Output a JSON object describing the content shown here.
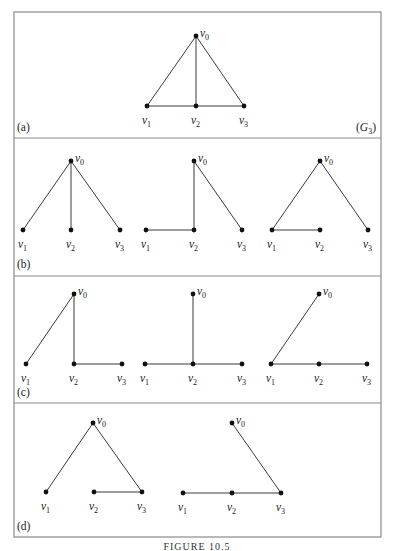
{
  "figure": {
    "caption": "FIGURE 10.5",
    "frame": {
      "x": 14,
      "y": 12,
      "width": 367,
      "height": 525
    },
    "dividers_y": [
      138,
      276,
      403
    ],
    "colors": {
      "frame": "#8a8a8a",
      "edge": "#3a3a3a",
      "node": "#111111",
      "text": "#222222"
    }
  },
  "diagram_data": {
    "panels": [
      {
        "id": "a",
        "label": "(a)",
        "label_pos": [
          17,
          131
        ],
        "graph_name": "(G",
        "graph_name_sub": "3",
        "graph_name_close": ")",
        "graph_name_pos": [
          356,
          131
        ],
        "graphs": [
          {
            "nodes": {
              "v0": [
                196,
                36
              ],
              "v1": [
                147,
                106
              ],
              "v2": [
                196,
                106
              ],
              "v3": [
                244,
                106
              ]
            },
            "edges": [
              [
                "v0",
                "v1"
              ],
              [
                "v0",
                "v2"
              ],
              [
                "v0",
                "v3"
              ],
              [
                "v1",
                "v2"
              ],
              [
                "v2",
                "v3"
              ]
            ]
          }
        ]
      },
      {
        "id": "b",
        "label": "(b)",
        "label_pos": [
          17,
          268
        ],
        "graphs": [
          {
            "nodes": {
              "v0": [
                71,
                161
              ],
              "v1": [
                23,
                230
              ],
              "v2": [
                71,
                230
              ],
              "v3": [
                120,
                230
              ]
            },
            "edges": [
              [
                "v0",
                "v1"
              ],
              [
                "v0",
                "v2"
              ],
              [
                "v0",
                "v3"
              ]
            ]
          },
          {
            "nodes": {
              "v0": [
                194,
                161
              ],
              "v1": [
                146,
                230
              ],
              "v2": [
                194,
                230
              ],
              "v3": [
                242,
                230
              ]
            },
            "edges": [
              [
                "v1",
                "v2"
              ],
              [
                "v2",
                "v0"
              ],
              [
                "v0",
                "v3"
              ]
            ]
          },
          {
            "nodes": {
              "v0": [
                320,
                161
              ],
              "v1": [
                272,
                230
              ],
              "v2": [
                320,
                230
              ],
              "v3": [
                368,
                230
              ]
            },
            "edges": [
              [
                "v1",
                "v0"
              ],
              [
                "v0",
                "v3"
              ],
              [
                "v1",
                "v2"
              ]
            ]
          }
        ]
      },
      {
        "id": "c",
        "label": "(c)",
        "label_pos": [
          17,
          396
        ],
        "graphs": [
          {
            "nodes": {
              "v0": [
                74,
                294
              ],
              "v1": [
                26,
                364
              ],
              "v2": [
                74,
                364
              ],
              "v3": [
                122,
                364
              ]
            },
            "edges": [
              [
                "v1",
                "v0"
              ],
              [
                "v0",
                "v2"
              ],
              [
                "v2",
                "v3"
              ]
            ]
          },
          {
            "nodes": {
              "v0": [
                193,
                294
              ],
              "v1": [
                145,
                364
              ],
              "v2": [
                193,
                364
              ],
              "v3": [
                242,
                364
              ]
            },
            "edges": [
              [
                "v1",
                "v2"
              ],
              [
                "v2",
                "v3"
              ],
              [
                "v2",
                "v0"
              ]
            ]
          },
          {
            "nodes": {
              "v0": [
                319,
                294
              ],
              "v1": [
                271,
                364
              ],
              "v2": [
                319,
                364
              ],
              "v3": [
                367,
                364
              ]
            },
            "edges": [
              [
                "v1",
                "v0"
              ],
              [
                "v1",
                "v2"
              ],
              [
                "v2",
                "v3"
              ]
            ]
          }
        ]
      },
      {
        "id": "d",
        "label": "(d)",
        "label_pos": [
          17,
          530
        ],
        "graphs": [
          {
            "nodes": {
              "v0": [
                93,
                423
              ],
              "v1": [
                46,
                492
              ],
              "v2": [
                94,
                492
              ],
              "v3": [
                142,
                492
              ]
            },
            "edges": [
              [
                "v1",
                "v0"
              ],
              [
                "v0",
                "v3"
              ],
              [
                "v2",
                "v3"
              ]
            ]
          },
          {
            "nodes": {
              "v0": [
                232,
                423
              ],
              "v1": [
                183,
                493
              ],
              "v2": [
                232,
                493
              ],
              "v3": [
                281,
                493
              ]
            },
            "edges": [
              [
                "v0",
                "v3"
              ],
              [
                "v1",
                "v2"
              ],
              [
                "v2",
                "v3"
              ]
            ]
          }
        ]
      }
    ],
    "vertex_labels": {
      "v0": {
        "base": "v",
        "sub": "0"
      },
      "v1": {
        "base": "v",
        "sub": "1"
      },
      "v2": {
        "base": "v",
        "sub": "2"
      },
      "v3": {
        "base": "v",
        "sub": "3"
      }
    }
  }
}
